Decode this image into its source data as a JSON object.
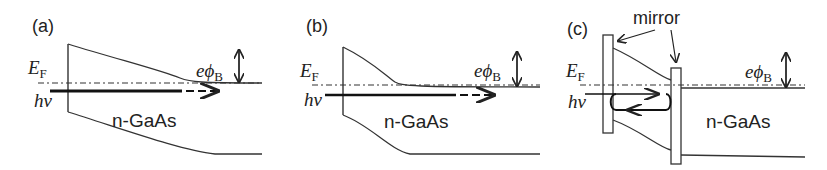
{
  "panels": [
    {
      "label": "(a)",
      "ef": "E",
      "ef_sub": "F",
      "hv": "hν",
      "material": "n-GaAs",
      "barrier": "eϕ",
      "barrier_sub": "B"
    },
    {
      "label": "(b)",
      "ef": "E",
      "ef_sub": "F",
      "hv": "hν",
      "material": "n-GaAs",
      "barrier": "eϕ",
      "barrier_sub": "B"
    },
    {
      "label": "(c)",
      "ef": "E",
      "ef_sub": "F",
      "hv": "hν",
      "material": "n-GaAs",
      "barrier": "eϕ",
      "barrier_sub": "B",
      "mirror": "mirror"
    }
  ],
  "colors": {
    "line": "#333333",
    "background": "#ffffff"
  }
}
